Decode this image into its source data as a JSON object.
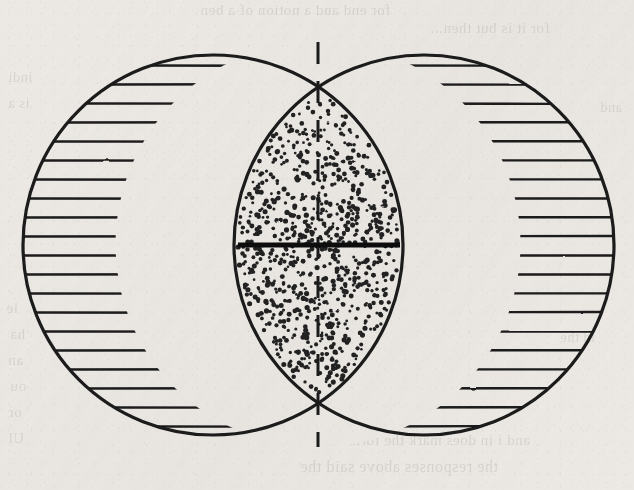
{
  "figure": {
    "caption": "",
    "canvas": {
      "width": 634,
      "height": 490
    },
    "background_color": "#ece9e4",
    "ink_color": "#1a1a1a"
  },
  "geometry": {
    "circles": [
      {
        "id": "left-circle",
        "label": "Left circle",
        "cx": 213,
        "cy": 245,
        "r": 190,
        "fill_pattern": "horizontal-hatch"
      },
      {
        "id": "right-circle",
        "label": "Right circle",
        "cx": 424,
        "cy": 245,
        "r": 190,
        "fill_pattern": "horizontal-hatch"
      }
    ],
    "lens": {
      "id": "intersection-lens",
      "label": "Lens-shaped intersection region",
      "fill_pattern": "stipple",
      "left_extent_x": 182,
      "right_extent_x": 456,
      "top_cusp": {
        "x": 318,
        "y": 42
      },
      "bottom_cusp": {
        "x": 318,
        "y": 447
      },
      "center_x": 318
    },
    "center_line_vertical": {
      "id": "vertical-dashed-axis",
      "label": "Vertical dashed centre line",
      "x": 318,
      "y1": 42,
      "y2": 447,
      "style": "dashed",
      "dash_length": 22,
      "gap_length": 17,
      "stroke_width": 3
    },
    "center_line_horizontal": {
      "id": "horizontal-solid-bar",
      "label": "Horizontal solid chord",
      "x1": 238,
      "x2": 400,
      "y": 245,
      "style": "solid",
      "stroke_width": 5
    },
    "hatching": {
      "orientation": "horizontal",
      "spacing_px": 19,
      "stroke_width": 2.4,
      "line_count": 22
    },
    "stipple": {
      "dot_count": 880,
      "dot_radius_min": 1.3,
      "dot_radius_max": 2.6,
      "color": "#222222"
    }
  },
  "show_through_text": [
    {
      "id": "ghost-1",
      "text": "for end and a notion of a ben",
      "x": 200,
      "y": 2,
      "size": 15
    },
    {
      "id": "ghost-2",
      "text": "for it is but then...",
      "x": 430,
      "y": 20,
      "size": 15
    },
    {
      "id": "ghost-3",
      "text": "lunar",
      "x": 240,
      "y": 52,
      "size": 14
    },
    {
      "id": "ghost-4",
      "text": "indi",
      "x": 8,
      "y": 70,
      "size": 14
    },
    {
      "id": "ghost-5",
      "text": "is a",
      "x": 8,
      "y": 96,
      "size": 14
    },
    {
      "id": "ghost-6",
      "text": "and",
      "x": 600,
      "y": 100,
      "size": 14
    },
    {
      "id": "ghost-7",
      "text": "le",
      "x": 6,
      "y": 300,
      "size": 15
    },
    {
      "id": "ghost-8",
      "text": "ha",
      "x": 10,
      "y": 326,
      "size": 15
    },
    {
      "id": "ghost-9",
      "text": "an",
      "x": 8,
      "y": 352,
      "size": 15
    },
    {
      "id": "ghost-10",
      "text": "ou",
      "x": 10,
      "y": 378,
      "size": 15
    },
    {
      "id": "ghost-11",
      "text": "or",
      "x": 8,
      "y": 404,
      "size": 15
    },
    {
      "id": "ghost-12",
      "text": "Ul",
      "x": 8,
      "y": 430,
      "size": 15
    },
    {
      "id": "ghost-13",
      "text": "and i in does mark the form of",
      "x": 330,
      "y": 432,
      "size": 15
    },
    {
      "id": "ghost-14",
      "text": "the responses above said the",
      "x": 300,
      "y": 458,
      "size": 16
    },
    {
      "id": "ghost-15",
      "text": "le of ex of be",
      "x": 340,
      "y": 300,
      "size": 14
    },
    {
      "id": "ghost-16",
      "text": "id the",
      "x": 560,
      "y": 330,
      "size": 14
    }
  ]
}
